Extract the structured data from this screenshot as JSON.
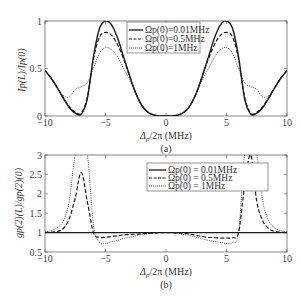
{
  "chart_data": [
    {
      "panel": "(a)",
      "type": "line",
      "title": "",
      "xlabel": "Δp/2π (MHz)",
      "ylabel": "Ip(L)/Ip(0)",
      "xlim": [
        -10,
        10
      ],
      "ylim": [
        0,
        1
      ],
      "xticks": [
        -10,
        -5,
        0,
        5,
        10
      ],
      "yticks": [
        0,
        0.5,
        1
      ],
      "xtick_labels": [
        "−10",
        "−5",
        "0",
        "5",
        "10"
      ],
      "ytick_labels": [
        "0",
        "0.5",
        "1"
      ],
      "grid": false,
      "legend_position": "upper center",
      "x": [
        -10,
        -9.5,
        -9,
        -8.5,
        -8,
        -7.5,
        -7,
        -6.5,
        -6,
        -5.5,
        -5,
        -4.5,
        -4,
        -3.5,
        -3,
        -2.5,
        -2,
        -1.5,
        -1,
        -0.5,
        0,
        0.5,
        1,
        1.5,
        2,
        2.5,
        3,
        3.5,
        4,
        4.5,
        5,
        5.5,
        6,
        6.5,
        7,
        7.5,
        8,
        8.5,
        9,
        9.5,
        10
      ],
      "series": [
        {
          "name": "Ωp(0) = 0.01MHz",
          "style": "solid",
          "values": [
            0.48,
            0.4,
            0.3,
            0.19,
            0.09,
            0.03,
            0.02,
            0.18,
            0.62,
            0.92,
            1.0,
            0.96,
            0.82,
            0.62,
            0.42,
            0.24,
            0.11,
            0.04,
            0.01,
            0.0,
            0.0,
            0.0,
            0.01,
            0.04,
            0.11,
            0.24,
            0.42,
            0.62,
            0.82,
            0.96,
            1.0,
            0.92,
            0.62,
            0.18,
            0.02,
            0.03,
            0.09,
            0.19,
            0.3,
            0.4,
            0.48
          ]
        },
        {
          "name": "Ωp(0) = 0.5MHz",
          "style": "dashed",
          "values": [
            0.48,
            0.4,
            0.3,
            0.2,
            0.1,
            0.04,
            0.03,
            0.2,
            0.6,
            0.83,
            0.88,
            0.85,
            0.75,
            0.6,
            0.42,
            0.24,
            0.11,
            0.04,
            0.01,
            0.0,
            0.0,
            0.0,
            0.01,
            0.04,
            0.11,
            0.24,
            0.42,
            0.6,
            0.75,
            0.85,
            0.88,
            0.83,
            0.6,
            0.2,
            0.03,
            0.04,
            0.1,
            0.2,
            0.3,
            0.4,
            0.48
          ]
        },
        {
          "name": "Ωp(0) = 1MHz",
          "style": "dotted",
          "values": [
            0.48,
            0.4,
            0.3,
            0.22,
            0.2,
            0.28,
            0.31,
            0.35,
            0.5,
            0.66,
            0.72,
            0.7,
            0.62,
            0.5,
            0.38,
            0.24,
            0.12,
            0.05,
            0.01,
            0.0,
            0.0,
            0.0,
            0.01,
            0.05,
            0.12,
            0.24,
            0.38,
            0.5,
            0.62,
            0.7,
            0.72,
            0.66,
            0.5,
            0.35,
            0.31,
            0.28,
            0.2,
            0.22,
            0.3,
            0.4,
            0.48
          ]
        }
      ]
    },
    {
      "panel": "(b)",
      "type": "line",
      "title": "",
      "xlabel": "Δp/2π (MHz)",
      "ylabel": "gp(2)(L)/gp(2)(0)",
      "xlim": [
        -10,
        10
      ],
      "ylim": [
        0.5,
        3
      ],
      "xticks": [
        -10,
        -5,
        0,
        5,
        10
      ],
      "yticks": [
        0.5,
        1,
        1.5,
        2,
        2.5,
        3
      ],
      "xtick_labels": [
        "−10",
        "−5",
        "0",
        "5",
        "10"
      ],
      "ytick_labels": [
        "0.5",
        "1",
        "1.5",
        "2",
        "2.5",
        "3"
      ],
      "grid": false,
      "legend_position": "upper center",
      "x": [
        -10,
        -9.5,
        -9,
        -8.5,
        -8,
        -7.5,
        -7,
        -6.5,
        -6,
        -5.5,
        -5,
        -4.5,
        -4,
        -3.5,
        -3,
        -2.5,
        -2,
        -1.5,
        -1,
        -0.5,
        0,
        0.5,
        1,
        1.5,
        2,
        2.5,
        3,
        3.5,
        4,
        4.5,
        5,
        5.5,
        6,
        6.5,
        7,
        7.5,
        8,
        8.5,
        9,
        9.5,
        10
      ],
      "series": [
        {
          "name": "Ωp(0) = 0.01MHz",
          "style": "solid",
          "values": [
            1.0,
            1.0,
            1.0,
            1.0,
            1.0,
            1.0,
            1.0,
            1.0,
            1.0,
            1.0,
            1.0,
            1.0,
            1.0,
            1.0,
            1.0,
            1.0,
            1.0,
            1.0,
            1.0,
            1.0,
            1.0,
            1.0,
            1.0,
            1.0,
            1.0,
            1.0,
            1.0,
            1.0,
            1.0,
            1.0,
            1.0,
            1.0,
            1.0,
            1.0,
            1.0,
            1.0,
            1.0,
            1.0,
            1.0,
            1.0,
            1.0
          ]
        },
        {
          "name": "Ωp(0) = 0.5MHz",
          "style": "dashed",
          "values": [
            1.0,
            1.01,
            1.03,
            1.1,
            1.35,
            1.9,
            2.55,
            1.8,
            1.0,
            0.88,
            0.88,
            0.9,
            0.92,
            0.94,
            0.95,
            0.96,
            0.97,
            0.98,
            0.99,
            1.0,
            1.0,
            1.0,
            0.99,
            0.98,
            0.96,
            0.93,
            0.9,
            0.88,
            0.87,
            0.86,
            0.86,
            0.87,
            1.0,
            2.2,
            3.0,
            1.8,
            1.3,
            1.1,
            1.03,
            1.01,
            1.0
          ]
        },
        {
          "name": "Ωp(0) = 1MHz",
          "style": "dotted",
          "values": [
            1.02,
            1.05,
            1.12,
            1.3,
            1.8,
            3.0,
            3.0,
            3.0,
            1.2,
            0.75,
            0.72,
            0.76,
            0.8,
            0.85,
            0.88,
            0.92,
            0.95,
            0.97,
            0.99,
            1.0,
            1.0,
            1.0,
            0.98,
            0.95,
            0.92,
            0.88,
            0.84,
            0.8,
            0.77,
            0.75,
            0.72,
            0.75,
            1.0,
            3.0,
            3.0,
            3.0,
            1.8,
            1.3,
            1.12,
            1.05,
            1.02
          ]
        }
      ]
    }
  ],
  "panels": {
    "a": {
      "caption": "(a)",
      "xlabel_main": "Δ",
      "xlabel_sub": "p",
      "xlabel_rest": "/2π  (MHz)",
      "ylabel": "Ip(L)/Ip(0)",
      "legend": [
        "Ωp(0)=0.01MHz",
        "Ωp(0)=0.5MHz",
        "Ωp(0)=1MHz"
      ]
    },
    "b": {
      "caption": "(b)",
      "xlabel_main": "Δ",
      "xlabel_sub": "p",
      "xlabel_rest": "/2π  (MHz)",
      "ylabel": "gp(2)(L)/gp(2)(0)",
      "legend": [
        "Ωp(0) = 0.01MHz",
        "Ωp(0) = 0.5MHz",
        "Ωp(0) = 1MHz"
      ]
    }
  },
  "colors": {
    "line": "#1a1a1a",
    "frame": "#555555",
    "text": "#333333"
  }
}
